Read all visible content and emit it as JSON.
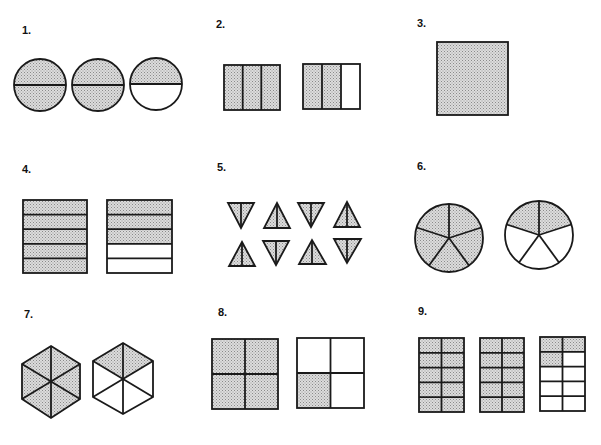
{
  "colors": {
    "stroke": "#1a1a1a",
    "shade_base": "#d8d8d8",
    "shade_dot": "#8a8a8a",
    "background": "#ffffff"
  },
  "problems": [
    {
      "number": "1.",
      "shape": "circle",
      "parts_per_shape": 2,
      "shapes": 3,
      "shaded": [
        2,
        2,
        1
      ]
    },
    {
      "number": "2.",
      "shape": "rectangle",
      "parts_per_shape": 3,
      "shapes": 2,
      "shaded": [
        3,
        2
      ]
    },
    {
      "number": "3.",
      "shape": "square",
      "parts_per_shape": 1,
      "shapes": 1,
      "shaded": [
        1
      ]
    },
    {
      "number": "4.",
      "shape": "square-horizontal-strips",
      "parts_per_shape": 5,
      "shapes": 2,
      "shaded": [
        5,
        3
      ]
    },
    {
      "number": "5.",
      "shape": "triangle",
      "parts_per_shape": 2,
      "shapes": 8,
      "shaded": [
        2,
        2,
        2,
        2,
        2,
        2,
        2,
        2
      ]
    },
    {
      "number": "6.",
      "shape": "circle-pie",
      "parts_per_shape": 5,
      "shapes": 2,
      "shaded": [
        5,
        2
      ]
    },
    {
      "number": "7.",
      "shape": "hexagon",
      "parts_per_shape": 6,
      "shapes": 2,
      "shaded": [
        6,
        2
      ]
    },
    {
      "number": "8.",
      "shape": "square-quarters",
      "parts_per_shape": 4,
      "shapes": 2,
      "shaded": [
        4,
        1
      ]
    },
    {
      "number": "9.",
      "shape": "rectangle-grid-2x5",
      "parts_per_shape": 10,
      "shapes": 3,
      "shaded": [
        10,
        10,
        3
      ]
    }
  ]
}
